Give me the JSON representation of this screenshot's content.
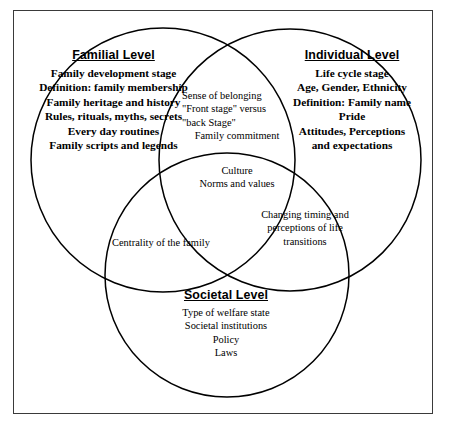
{
  "diagram": {
    "type": "venn-3-circle",
    "title_present": false,
    "border_color": "#3a3a3a",
    "circle_color": "#000000",
    "background": "#ffffff",
    "circles": [
      {
        "id": "familial",
        "heading": "Familial Level",
        "items": [
          "Family development stage",
          "Definition: family membership",
          "Family heritage and history",
          "Rules, rituals, myths, secrets",
          "Every day routines",
          "Family scripts and legends"
        ]
      },
      {
        "id": "individual",
        "heading": "Individual Level",
        "items": [
          "Life cycle stage",
          "Age, Gender, Ethnicity",
          "Definition: Family name",
          "Pride",
          "Attitudes, Perceptions",
          "and expectations"
        ]
      },
      {
        "id": "societal",
        "heading": "Societal Level",
        "items": [
          "Type of welfare state",
          "Societal institutions",
          "Policy",
          "Laws"
        ]
      }
    ],
    "overlaps": [
      {
        "id": "familial-individual",
        "items": [
          "Sense of belonging",
          "\"Front stage\" versus",
          "\"back Stage\"",
          "Family commitment"
        ]
      },
      {
        "id": "center-all-three",
        "items": [
          "Culture",
          "Norms and values"
        ]
      },
      {
        "id": "familial-societal",
        "items": [
          "Centrality of the family"
        ]
      },
      {
        "id": "individual-societal",
        "items": [
          "Changing timing and",
          "perceptions of life",
          "transitions"
        ]
      }
    ]
  }
}
